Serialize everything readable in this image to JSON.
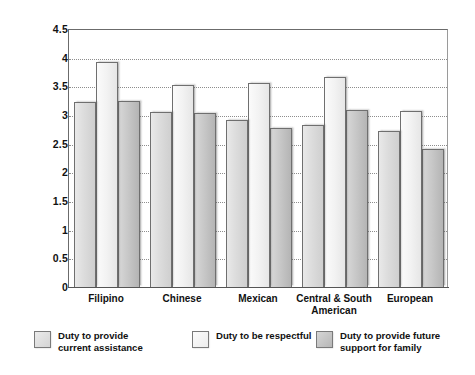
{
  "chart_data": {
    "type": "bar",
    "title": "",
    "xlabel": "",
    "ylabel": "Strength of Value",
    "ylim": [
      0,
      4.5
    ],
    "yticks": [
      "0",
      "0.5",
      "1",
      "1.5",
      "2",
      "2.5",
      "3",
      "3.5",
      "4",
      "4.5"
    ],
    "grid": true,
    "legend_position": "bottom",
    "categories": [
      "Filipino",
      "Chinese",
      "Mexican",
      "Central & South\nAmerican",
      "European"
    ],
    "series": [
      {
        "name": "Duty to provide current assistance",
        "color": "#dcdcdc",
        "values": [
          3.22,
          3.05,
          2.92,
          2.82,
          2.72
        ]
      },
      {
        "name": "Duty to be respectful",
        "color": "#f2f2f2",
        "values": [
          3.92,
          3.53,
          3.55,
          3.66,
          3.07
        ]
      },
      {
        "name": "Duty to provide future support for family",
        "color": "#c6c6c6",
        "values": [
          3.25,
          3.04,
          2.77,
          3.09,
          2.4
        ]
      }
    ]
  },
  "axis": {
    "y_title": "Strength of Value",
    "ticks": [
      {
        "label": "4.5",
        "value": 4.5
      },
      {
        "label": "4",
        "value": 4
      },
      {
        "label": "3.5",
        "value": 3.5
      },
      {
        "label": "3",
        "value": 3
      },
      {
        "label": "2.5",
        "value": 2.5
      },
      {
        "label": "2",
        "value": 2
      },
      {
        "label": "1.5",
        "value": 1.5
      },
      {
        "label": "1",
        "value": 1
      },
      {
        "label": "0.5",
        "value": 0.5
      },
      {
        "label": "0",
        "value": 0
      }
    ]
  },
  "legend": {
    "items": [
      {
        "label": "Duty to provide\ncurrent assistance",
        "swatch": "s1"
      },
      {
        "label": "Duty to be respectful",
        "swatch": "s2"
      },
      {
        "label": "Duty to provide future\nsupport for family",
        "swatch": "s3"
      }
    ]
  }
}
